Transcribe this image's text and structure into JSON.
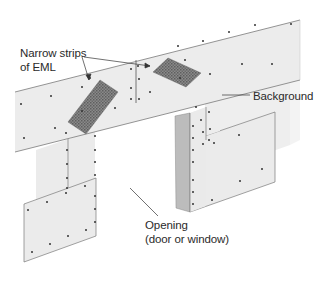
{
  "diagram": {
    "labels": {
      "eml_line1": "Narrow strips",
      "eml_line2": "of EML",
      "background": "Background",
      "opening_line1": "Opening",
      "opening_line2": "(door or window)"
    },
    "colors": {
      "panel": "#ececec",
      "panel_edge": "#7a7a7a",
      "panel_side": "#bdbdbd",
      "eml": "#7c7c7c",
      "nail": "#333333",
      "text": "#2a2a2a"
    }
  }
}
